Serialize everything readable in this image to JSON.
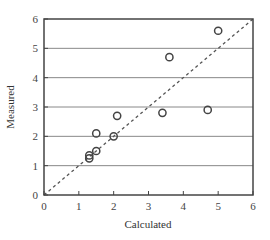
{
  "chart_data": {
    "type": "scatter",
    "title": "",
    "xlabel": "Calculated",
    "ylabel": "Measured",
    "xlim": [
      0,
      6
    ],
    "ylim": [
      0,
      6
    ],
    "xticks": [
      "0",
      "1",
      "2",
      "3",
      "4",
      "5",
      "6"
    ],
    "yticks": [
      "0",
      "1",
      "2",
      "3",
      "4",
      "5",
      "6"
    ],
    "grid": "horizontal",
    "legend": null,
    "series": [
      {
        "name": "data",
        "marker": "open-circle",
        "points": [
          {
            "x": 1.3,
            "y": 1.25
          },
          {
            "x": 1.3,
            "y": 1.35
          },
          {
            "x": 1.5,
            "y": 1.5
          },
          {
            "x": 1.5,
            "y": 2.1
          },
          {
            "x": 2.0,
            "y": 2.0
          },
          {
            "x": 2.1,
            "y": 2.7
          },
          {
            "x": 3.4,
            "y": 2.8
          },
          {
            "x": 3.6,
            "y": 4.7
          },
          {
            "x": 4.7,
            "y": 2.9
          },
          {
            "x": 5.0,
            "y": 5.6
          }
        ]
      }
    ],
    "reference_line": {
      "style": "dashed",
      "from": [
        0,
        0
      ],
      "to": [
        6,
        6
      ],
      "label": "y = x"
    }
  },
  "colors": {
    "axis": "#444444",
    "grid": "#888888",
    "marker": "#444444",
    "dash": "#555555"
  }
}
